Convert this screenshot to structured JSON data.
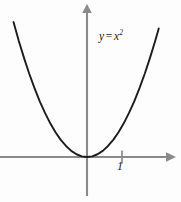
{
  "figure": {
    "background_color": "#fdfdfd",
    "curve_color": "#1c1c1c",
    "axis_color": "#8a8a8a"
  },
  "labels": {
    "equation_y": "y",
    "equation_equals": "=",
    "equation_base": "x",
    "equation_exponent": "2",
    "tick_one": "1"
  },
  "chart_data": {
    "type": "line",
    "title": "",
    "subtitle": "",
    "xlabel": "",
    "ylabel": "",
    "annotations": [
      {
        "text": "y = x²",
        "x": 1.05,
        "y": 3.9
      }
    ],
    "grid": false,
    "legend": null,
    "xlim": [
      -2.45,
      2.6
    ],
    "ylim": [
      -1.1,
      4.4
    ],
    "xticks": [
      1
    ],
    "xtick_labels": [
      "1"
    ],
    "yticks": [],
    "ytick_labels": [],
    "axis_arrows": {
      "x_positive": true,
      "y_positive": true
    },
    "series": [
      {
        "name": "y = x²",
        "function": "y = x^2",
        "x": [
          -2.1,
          -1.95,
          -1.8,
          -1.65,
          -1.5,
          -1.35,
          -1.2,
          -1.05,
          -0.9,
          -0.75,
          -0.6,
          -0.45,
          -0.3,
          -0.15,
          0.0,
          0.15,
          0.3,
          0.45,
          0.6,
          0.75,
          0.9,
          1.05,
          1.2,
          1.35,
          1.5,
          1.65,
          1.8,
          1.95,
          2.05
        ],
        "values": [
          4.41,
          3.8,
          3.24,
          2.72,
          2.25,
          1.82,
          1.44,
          1.1,
          0.81,
          0.56,
          0.36,
          0.2,
          0.09,
          0.02,
          0.0,
          0.02,
          0.09,
          0.2,
          0.36,
          0.56,
          0.81,
          1.1,
          1.44,
          1.82,
          2.25,
          2.72,
          3.24,
          3.8,
          4.2
        ]
      }
    ]
  }
}
